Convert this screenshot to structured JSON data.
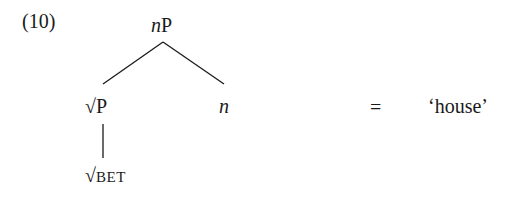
{
  "example": {
    "number": "(10)",
    "tree": {
      "root": {
        "prefix_italic": "n",
        "suffix": "P"
      },
      "left": {
        "root_sign": "√",
        "label": "P"
      },
      "right": {
        "label_italic": "n"
      },
      "leaf": {
        "root_sign": "√",
        "label_smallcaps": "BET"
      }
    },
    "equals": "=",
    "gloss": "‘house’"
  },
  "colors": {
    "text": "#1a1a1a",
    "lines": "#1a1a1a",
    "background": "#ffffff"
  }
}
